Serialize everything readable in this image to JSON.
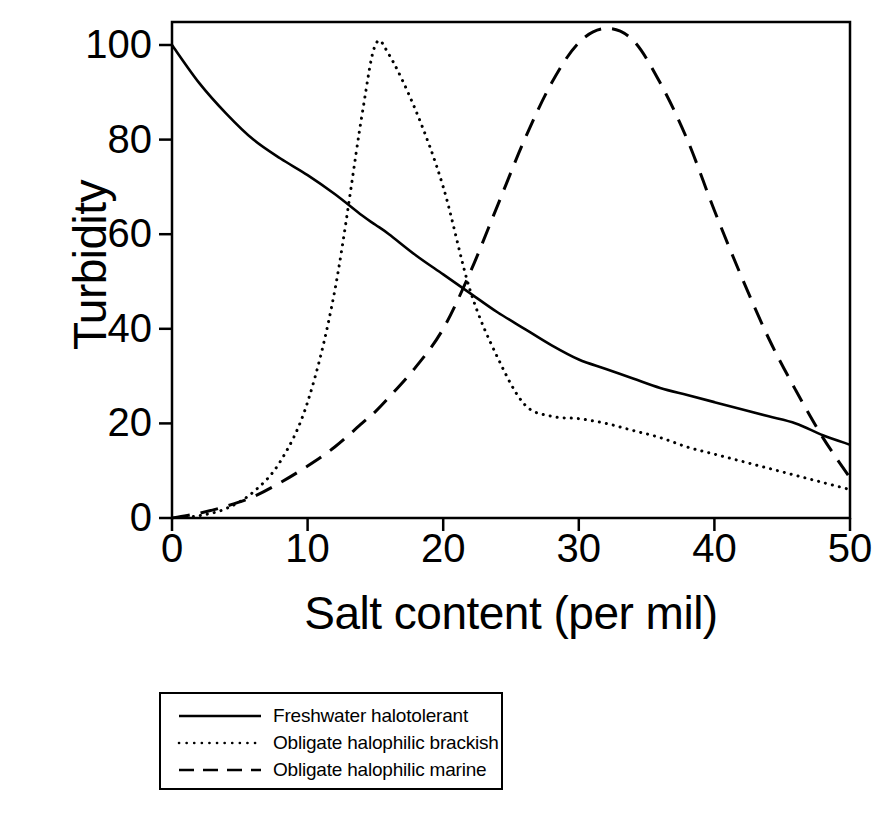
{
  "chart_data": {
    "type": "line",
    "title": "",
    "xlabel": "Salt content (per mil)",
    "ylabel": "Turbidity",
    "xlim": [
      0,
      50
    ],
    "ylim": [
      0,
      107
    ],
    "xticks": [
      "0",
      "10",
      "20",
      "30",
      "40",
      "50"
    ],
    "xtick_values": [
      0,
      10,
      20,
      30,
      40,
      50
    ],
    "yticks": [
      "0",
      "20",
      "40",
      "60",
      "80",
      "100"
    ],
    "ytick_values": [
      0,
      20,
      40,
      60,
      80,
      100
    ],
    "grid": false,
    "legend_position": "below-plot",
    "x": [
      0,
      2,
      4,
      6,
      8,
      10,
      12,
      14,
      15,
      16,
      18,
      20,
      22,
      24,
      26,
      28,
      30,
      32,
      34,
      36,
      38,
      40,
      42,
      44,
      46,
      48,
      50
    ],
    "series": [
      {
        "name": "Freshwater halotolerant",
        "style": "solid",
        "color": "#000000",
        "values": [
          100,
          92,
          85.5,
          80,
          76,
          72.5,
          68.5,
          64,
          62,
          60,
          55.5,
          51.5,
          47.5,
          43.5,
          40,
          36.5,
          33.5,
          31.5,
          29.5,
          27.5,
          26,
          24.5,
          23,
          21.5,
          20,
          17.5,
          15.5
        ]
      },
      {
        "name": "Obligate halophilic brackish",
        "style": "dotted",
        "color": "#000000",
        "values": [
          0,
          0.5,
          2,
          5.5,
          12,
          24.5,
          48,
          85,
          100,
          98,
          86,
          70,
          48,
          34,
          24,
          21.5,
          21,
          20,
          18.5,
          17,
          15,
          13.5,
          12,
          10.5,
          9,
          7.5,
          6
        ]
      },
      {
        "name": "Obligate halophilic marine",
        "style": "dashed",
        "color": "#000000",
        "values": [
          0,
          1,
          2.5,
          4.5,
          7.5,
          11,
          15,
          20,
          22.5,
          25.5,
          32,
          40,
          52,
          66,
          80,
          92,
          100.5,
          103.5,
          101,
          92,
          80,
          65,
          51,
          38,
          27,
          17,
          8.5
        ]
      }
    ]
  },
  "legend": {
    "items": [
      {
        "label": "Freshwater halotolerant",
        "style": "solid"
      },
      {
        "label": "Obligate halophilic brackish",
        "style": "dotted"
      },
      {
        "label": "Obligate halophilic marine",
        "style": "dashed"
      }
    ]
  }
}
